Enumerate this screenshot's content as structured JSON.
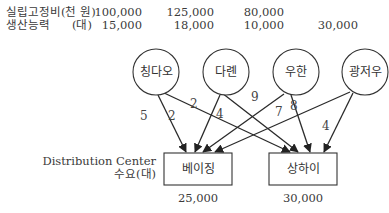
{
  "header": {
    "row1_label": "실립고정비(천 원)",
    "row2_label": "생산능력",
    "row2_unit": "(대)"
  },
  "plants": [
    {
      "name": "칭다오",
      "fixed_cost": "100,000",
      "capacity": "15,000"
    },
    {
      "name": "다롄",
      "fixed_cost": "125,000",
      "capacity": "18,000"
    },
    {
      "name": "우한",
      "fixed_cost": "80,000",
      "capacity": "10,000"
    },
    {
      "name": "광저우",
      "fixed_cost": "",
      "capacity": "30,000"
    }
  ],
  "distribution": {
    "label_line1": "Distribution Center",
    "label_line2": "수요(대)",
    "centers": [
      {
        "name": "베이징",
        "demand": "25,000"
      },
      {
        "name": "상하이",
        "demand": "30,000"
      }
    ]
  },
  "edges": [
    {
      "from": "칭다오",
      "to": "베이징",
      "cost": "5"
    },
    {
      "from": "칭다오",
      "to": "상하이",
      "cost": "2"
    },
    {
      "from": "다롄",
      "to": "베이징",
      "cost": "2"
    },
    {
      "from": "다롄",
      "to": "상하이",
      "cost": "4"
    },
    {
      "from": "우한",
      "to": "베이징",
      "cost": "9"
    },
    {
      "from": "우한",
      "to": "상하이",
      "cost": "8"
    },
    {
      "from": "광저우",
      "to": "베이징",
      "cost": "7"
    },
    {
      "from": "광저우",
      "to": "상하이",
      "cost": "4"
    }
  ]
}
